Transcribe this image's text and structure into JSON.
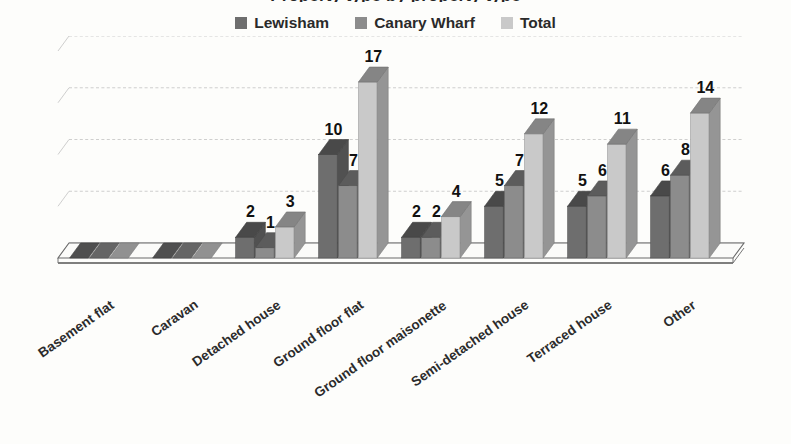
{
  "title": "Property type by property type",
  "legend": {
    "position": "top-center",
    "items": [
      {
        "label": "Lewisham",
        "color": "#6e6e6e",
        "icon": "legend-swatch-icon"
      },
      {
        "label": "Canary Wharf",
        "color": "#8c8c8c",
        "icon": "legend-swatch-icon"
      },
      {
        "label": "Total",
        "color": "#c9c9c9",
        "icon": "legend-swatch-icon"
      }
    ]
  },
  "chart_data": {
    "type": "bar",
    "title": "Property type by property type",
    "xlabel": "",
    "ylabel": "",
    "ylim": [
      0,
      20
    ],
    "yticks": [
      0,
      5,
      10,
      15,
      20
    ],
    "grid": true,
    "style": "3d-clustered-column",
    "legend_position": "top-center",
    "show_value_labels": true,
    "categories": [
      "Basement flat",
      "Caravan",
      "Detached house",
      "Ground floor flat",
      "Ground floor maisonette",
      "Semi-detached house",
      "Terraced house",
      "Other"
    ],
    "series": [
      {
        "name": "Lewisham",
        "color": "#6e6e6e",
        "values": [
          0,
          0,
          2,
          10,
          2,
          5,
          5,
          6
        ]
      },
      {
        "name": "Canary Wharf",
        "color": "#8c8c8c",
        "values": [
          0,
          0,
          1,
          7,
          2,
          7,
          6,
          8
        ]
      },
      {
        "name": "Total",
        "color": "#c9c9c9",
        "values": [
          0,
          0,
          3,
          17,
          4,
          12,
          11,
          14
        ]
      }
    ],
    "value_labels": {
      "Basement flat": [
        "",
        "",
        ""
      ],
      "Caravan": [
        "",
        "",
        ""
      ],
      "Detached house": [
        "2",
        "1",
        "3"
      ],
      "Ground floor flat": [
        "10",
        "7",
        "17"
      ],
      "Ground floor maisonette": [
        "2",
        "2",
        "4"
      ],
      "Semi-detached house": [
        "5",
        "7",
        "12"
      ],
      "Terraced house": [
        "5",
        "6",
        "11"
      ],
      "Other": [
        "6",
        "8",
        "14"
      ]
    }
  },
  "colors": {
    "background": "#fdfdfb",
    "gridline": "#c4c4c4",
    "axis": "#6a6a6a",
    "floor": "#fbfbf9",
    "text": "#1d1d1d"
  }
}
